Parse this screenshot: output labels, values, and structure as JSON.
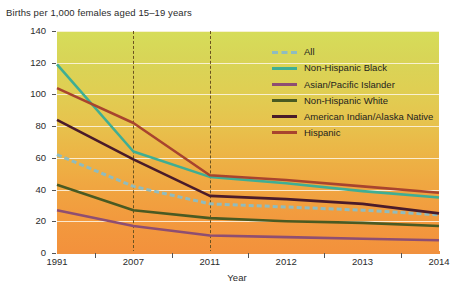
{
  "chart_data": {
    "type": "line",
    "title": "",
    "ylabel": "Births per 1,000 females aged 15–19 years",
    "xlabel": "Year",
    "categories": [
      "1991",
      "2007",
      "2011",
      "2012",
      "2013",
      "2014"
    ],
    "ylim": [
      0,
      140
    ],
    "ytick_values": [
      0,
      20,
      40,
      60,
      80,
      100,
      120,
      140
    ],
    "ytick_labels": [
      "0",
      "20",
      "40",
      "60",
      "80",
      "100",
      "120",
      "140"
    ],
    "grid": true,
    "legend_position": "inside-top-right",
    "annotations": [
      {
        "type": "vertical-dashed-line",
        "at": "2007"
      },
      {
        "type": "vertical-dashed-line",
        "at": "2011"
      }
    ],
    "series": [
      {
        "name": "All",
        "color": "#8fbcbf",
        "style": "dashed",
        "values": [
          62,
          42,
          31,
          29,
          27,
          24
        ]
      },
      {
        "name": "Non-Hispanic Black",
        "color": "#3fae94",
        "style": "solid",
        "values": [
          119,
          64,
          48,
          44,
          39,
          35
        ]
      },
      {
        "name": "Asian/Pacific Islander",
        "color": "#8e4e72",
        "style": "solid",
        "values": [
          27,
          17,
          11,
          10,
          9,
          8
        ]
      },
      {
        "name": "Non-Hispanic White",
        "color": "#4a5a22",
        "style": "solid",
        "values": [
          43,
          27,
          22,
          20,
          19,
          17
        ]
      },
      {
        "name": "American Indian/Alaska Native",
        "color": "#4a1b2a",
        "style": "solid",
        "values": [
          84,
          59,
          36,
          34,
          31,
          25
        ]
      },
      {
        "name": "Hispanic",
        "color": "#a8442e",
        "style": "solid",
        "values": [
          104,
          82,
          49,
          46,
          42,
          38
        ]
      }
    ]
  },
  "legend": {
    "items": [
      {
        "label": "All"
      },
      {
        "label": "Non-Hispanic Black"
      },
      {
        "label": "Asian/Pacific Islander"
      },
      {
        "label": "Non-Hispanic White"
      },
      {
        "label": "American Indian/Alaska Native"
      },
      {
        "label": "Hispanic"
      }
    ]
  },
  "axes": {
    "y_title": "Births per 1,000 females aged 15–19 years",
    "x_title": "Year"
  },
  "colors": {
    "plot_gradient_top": "#d6dd59",
    "plot_gradient_bottom": "#f3913c",
    "gridline": "#fdf6e6",
    "vertical_marker": "#6b5320",
    "text": "#2b2b2b"
  }
}
